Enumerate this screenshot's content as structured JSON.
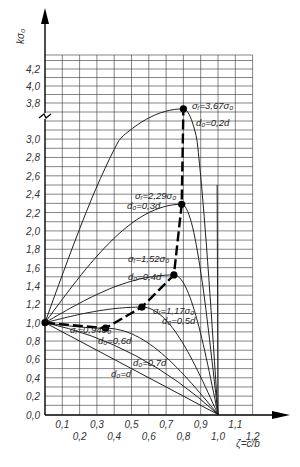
{
  "chart_data": {
    "type": "line",
    "title": "",
    "xlabel": "ζ=c/b",
    "ylabel": "kσ₀",
    "xlim": [
      0,
      1.2
    ],
    "ylim": [
      0,
      4.2
    ],
    "y_axis_break": {
      "between": [
        3.0,
        3.8
      ]
    },
    "grid": true,
    "x_ticks_upper": [
      "0,1",
      "0,3",
      "0,5",
      "0,7",
      "0,9",
      "1,1"
    ],
    "x_ticks_lower": [
      "0,2",
      "0,4",
      "0,6",
      "0,8",
      "1,0",
      "1,2"
    ],
    "y_ticks": [
      "0,0",
      "0,2",
      "0,4",
      "0,6",
      "0,8",
      "1,0",
      "1,2",
      "1,4",
      "1,6",
      "1,8",
      "2,0",
      "2,2",
      "2,4",
      "2,6",
      "2,8",
      "3,0",
      "3,8",
      "4,0",
      "4,2"
    ],
    "series": [
      {
        "name": "d₀=0.2d",
        "peak": {
          "x": 0.8,
          "y": 3.67
        },
        "peak_label": "σᵣ=3.67σ₀"
      },
      {
        "name": "d₀=0.3d",
        "peak": {
          "x": 0.79,
          "y": 2.29
        },
        "peak_label": "σᵣ=2.29σ₀"
      },
      {
        "name": "d₀=0.4d",
        "peak": {
          "x": 0.745,
          "y": 1.52
        },
        "peak_label": "σᵣ=1.52σ₀"
      },
      {
        "name": "d₀=0.5d",
        "peak": {
          "x": 0.56,
          "y": 1.17
        },
        "peak_label": "σᵣ=1.17σ₀"
      },
      {
        "name": "d₀=0.6d",
        "peak": {
          "x": 0.35,
          "y": 0.94
        },
        "peak_label": "σᵣ=0.94σ₀"
      },
      {
        "name": "d₀=0.7d",
        "points": [
          [
            0,
            1.0
          ],
          [
            1.0,
            0
          ]
        ]
      },
      {
        "name": "d₀=d",
        "points": [
          [
            0,
            1.0
          ],
          [
            1.0,
            0
          ]
        ]
      }
    ],
    "max_locus": {
      "style": "dashed",
      "points": [
        [
          0,
          1.0
        ],
        [
          0.35,
          0.94
        ],
        [
          0.56,
          1.17
        ],
        [
          0.745,
          1.52
        ],
        [
          0.79,
          2.29
        ],
        [
          0.8,
          3.67
        ]
      ]
    }
  },
  "labels": {
    "ylabel": "kσ₀",
    "xlabel": "ζ=c/b",
    "s02": "σᵣ=3,67σ₀",
    "d02": "d₀=0,2d",
    "s03": "σᵣ=2,29σ₀",
    "d03": "d₀=0,3d",
    "s04": "σᵣ=1,52σ₀",
    "d04": "d₀=0,4d",
    "s05": "σᵣ=1,17σ₀",
    "d05": "d₀=0,5d",
    "s06": "σᵣ=0,94σ₀",
    "d06": "d₀=0,6d",
    "d07": "d₀=0,7d",
    "d10": "d₀=d"
  }
}
